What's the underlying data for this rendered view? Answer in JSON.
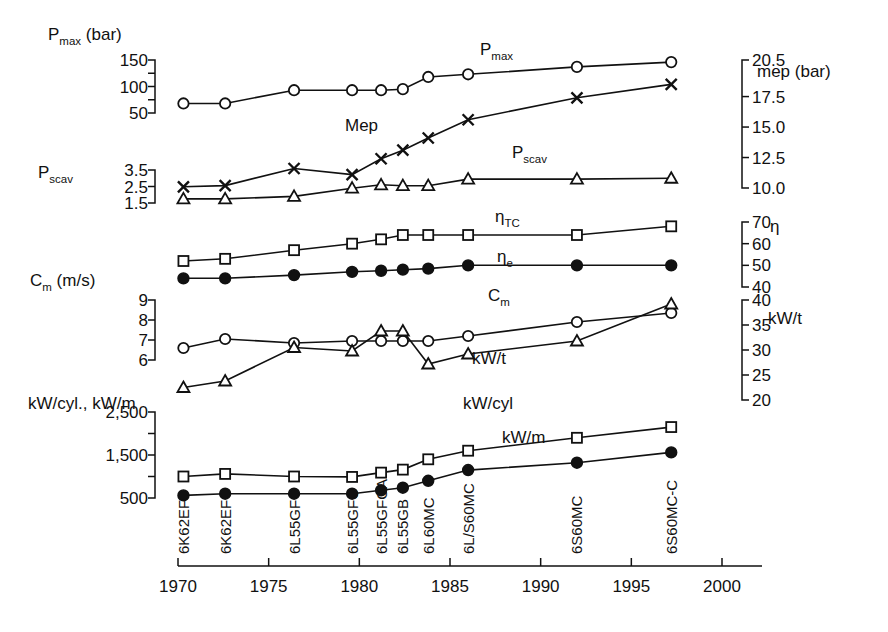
{
  "chart_data": {
    "type": "line",
    "title": "",
    "xlabel": "",
    "categories": [
      "6K62EF",
      "6K62EF",
      "6L55GF",
      "6L55GFC",
      "6L55GFCA",
      "6L55GB",
      "6L60MC",
      "6L/S60MC",
      "6S60MC",
      "6S60MC-C"
    ],
    "x": [
      1970.3,
      1972.6,
      1976.4,
      1979.6,
      1981.2,
      1982.4,
      1983.8,
      1986.0,
      1992.0,
      1997.2
    ],
    "x_axis": {
      "ticks": [
        1970,
        1975,
        1980,
        1985,
        1990,
        1995,
        2000
      ],
      "tick_labels": [
        "1970",
        "1975",
        "1980",
        "1985",
        "1990",
        "1995",
        "2000"
      ],
      "range": [
        1970,
        2000
      ]
    },
    "axes": [
      {
        "id": "pmax",
        "side": "left",
        "label": "P_max (bar)",
        "label_text": "Pmax (bar)",
        "label_base": "P",
        "label_sub": "max",
        "label_unit": "(bar)",
        "ticks": [
          150,
          125,
          100,
          75,
          50
        ],
        "tick_labels": [
          "150",
          "",
          "100",
          "",
          "50"
        ],
        "range": [
          50,
          150
        ]
      },
      {
        "id": "mep",
        "side": "right",
        "label": "mep (bar)",
        "ticks": [
          20.5,
          17.5,
          15.0,
          12.5,
          10.0
        ],
        "tick_labels": [
          "20.5",
          "17.5",
          "15.0",
          "12.5",
          "10.0"
        ],
        "range": [
          10.0,
          20.5
        ]
      },
      {
        "id": "pscav",
        "side": "left",
        "label_base": "P",
        "label_sub": "scav",
        "label_unit": "",
        "ticks": [
          3.5,
          2.5,
          1.5
        ],
        "tick_labels": [
          "3.5",
          "2.5",
          "1.5"
        ],
        "range": [
          1.5,
          3.5
        ]
      },
      {
        "id": "eta",
        "side": "right",
        "label": "η",
        "ticks": [
          70,
          60,
          50,
          40
        ],
        "tick_labels": [
          "70",
          "60",
          "50",
          "40"
        ],
        "range": [
          40,
          70
        ]
      },
      {
        "id": "cm",
        "side": "left",
        "label_base": "C",
        "label_sub": "m",
        "label_unit": "(m/s)",
        "ticks": [
          9,
          8,
          7,
          6
        ],
        "tick_labels": [
          "9",
          "8",
          "7",
          "6"
        ],
        "range": [
          6,
          9
        ]
      },
      {
        "id": "kwt",
        "side": "right",
        "label": "kW/t",
        "ticks": [
          40,
          35,
          30,
          25,
          20
        ],
        "tick_labels": [
          "40",
          "35",
          "30",
          "25",
          "20"
        ],
        "range": [
          20,
          40
        ]
      },
      {
        "id": "kw",
        "side": "left",
        "label": "kW/cyl., kW/m",
        "ticks": [
          2500,
          2000,
          1500,
          1000,
          500
        ],
        "tick_labels": [
          "2,500",
          "",
          "1,500",
          "",
          "500"
        ],
        "range": [
          500,
          2500
        ]
      }
    ],
    "series": [
      {
        "name": "Pmax",
        "label_base": "P",
        "label_sub": "max",
        "axis": "pmax",
        "marker": "circle-open",
        "unit": "bar",
        "values": [
          68,
          68,
          93,
          93,
          93,
          95,
          118,
          123,
          137,
          146
        ]
      },
      {
        "name": "Mep",
        "label_base": "Mep",
        "label_sub": "",
        "axis": "mep",
        "marker": "cross",
        "unit": "bar",
        "values": [
          10.1,
          10.2,
          11.6,
          11.1,
          12.4,
          13.1,
          14.1,
          15.6,
          17.4,
          18.5
        ]
      },
      {
        "name": "Pscav",
        "label_base": "P",
        "label_sub": "scav",
        "axis": "pscav",
        "marker": "triangle-open",
        "unit": "bar",
        "values": [
          1.75,
          1.75,
          1.9,
          2.4,
          2.6,
          2.55,
          2.55,
          2.95,
          2.95,
          3.0
        ]
      },
      {
        "name": "etaTC",
        "label_base": "η",
        "label_sub": "TC",
        "axis": "eta",
        "marker": "square-open",
        "unit": "%",
        "values": [
          52,
          53,
          57,
          60,
          62,
          64,
          64,
          64,
          64,
          68
        ]
      },
      {
        "name": "etae",
        "label_base": "η",
        "label_sub": "e",
        "axis": "eta",
        "marker": "circle-filled",
        "unit": "%",
        "values": [
          44,
          44,
          45.5,
          47,
          47.5,
          48,
          48.5,
          50,
          50,
          50
        ]
      },
      {
        "name": "Cm",
        "label_base": "C",
        "label_sub": "m",
        "axis": "cm",
        "marker": "circle-open",
        "unit": "m/s",
        "values": [
          6.6,
          7.05,
          6.85,
          6.95,
          6.95,
          6.95,
          6.95,
          7.2,
          7.9,
          8.35
        ]
      },
      {
        "name": "kW/t",
        "label_base": "kW/t",
        "label_sub": "",
        "axis": "kwt",
        "marker": "triangle-open",
        "unit": "kW/t",
        "values": [
          22.5,
          23.8,
          30.5,
          29.8,
          33.8,
          33.8,
          27.2,
          29.2,
          31.8,
          39.2
        ]
      },
      {
        "name": "kW/cyl",
        "label_base": "kW/cyl",
        "label_sub": "",
        "axis": "kw",
        "marker": "square-open",
        "unit": "kW",
        "values": [
          1000,
          1060,
          1000,
          990,
          1090,
          1160,
          1400,
          1600,
          1900,
          2150
        ]
      },
      {
        "name": "kW/m",
        "label_base": "kW/m",
        "label_sub": "",
        "axis": "kw",
        "marker": "circle-filled",
        "unit": "kW",
        "values": [
          560,
          600,
          600,
          600,
          680,
          740,
          900,
          1150,
          1320,
          1560
        ]
      }
    ],
    "annotations": [
      {
        "text": "Pmax",
        "base": "P",
        "sub": "max"
      },
      {
        "text": "Mep",
        "base": "Mep",
        "sub": ""
      },
      {
        "text": "Pscav",
        "base": "P",
        "sub": "scav"
      },
      {
        "text": "etaTC",
        "base": "η",
        "sub": "TC"
      },
      {
        "text": "etae",
        "base": "η",
        "sub": "e"
      },
      {
        "text": "Cm",
        "base": "C",
        "sub": "m"
      },
      {
        "text": "kW/t",
        "base": "kW/t",
        "sub": ""
      },
      {
        "text": "kW/cyl",
        "base": "kW/cyl",
        "sub": ""
      },
      {
        "text": "kW/m",
        "base": "kW/m",
        "sub": ""
      }
    ],
    "grid": false,
    "legend": "inline-annotations",
    "colors": {
      "ink": "#111111",
      "background": "#ffffff"
    }
  },
  "labels": {
    "pmax_axis_base": "P",
    "pmax_axis_sub": "max",
    "pmax_axis_unit": "(bar)",
    "pscav_axis_base": "P",
    "pscav_axis_sub": "scav",
    "cm_axis_base": "C",
    "cm_axis_sub": "m",
    "cm_axis_unit": "(m/s)",
    "kw_axis": "kW/cyl., kW/m",
    "mep_axis": "mep (bar)",
    "eta_axis": "η",
    "kwt_axis": "kW/t",
    "ann_pmax_base": "P",
    "ann_pmax_sub": "max",
    "ann_mep": "Mep",
    "ann_pscav_base": "P",
    "ann_pscav_sub": "scav",
    "ann_etatc_base": "η",
    "ann_etatc_sub": "TC",
    "ann_etae_base": "η",
    "ann_etae_sub": "e",
    "ann_cm_base": "C",
    "ann_cm_sub": "m",
    "ann_kwt": "kW/t",
    "ann_kwcyl": "kW/cyl",
    "ann_kwm": "kW/m"
  }
}
